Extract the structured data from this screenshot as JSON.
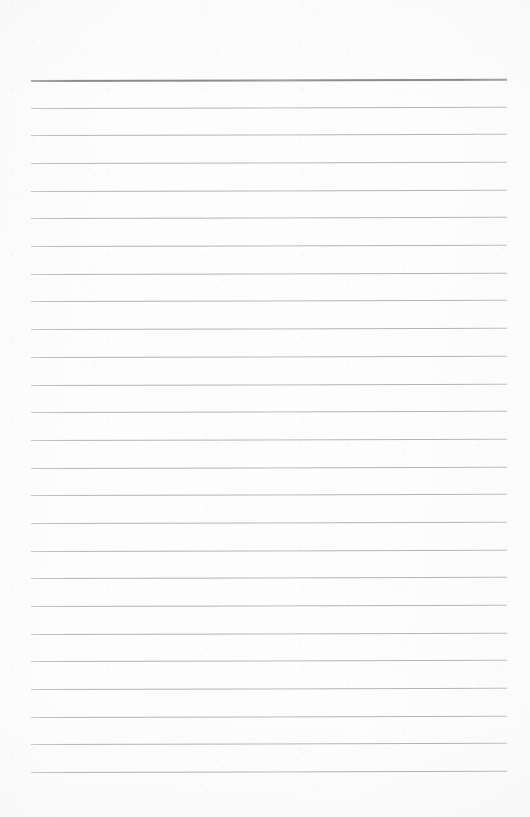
{
  "document": {
    "kind": "scanned-blank-ruled-paper",
    "page_width": 530,
    "page_height": 817,
    "background_color": "#fdfdfd",
    "text_content": "",
    "notes": "Blank lined writing paper; no text, headings, icons or page numbers are printed on the sheet."
  },
  "ruling": {
    "line_count": 26,
    "line_color": "#aeaeae",
    "header_line_color": "#8b8b8b",
    "header_line_thickness_px": 2,
    "line_thickness_px": 1,
    "line_left_px": 31,
    "line_right_px": 507,
    "line_width_px": 476,
    "first_line_y_px": 80,
    "last_line_y_px": 772,
    "line_spacing_px": 27.7,
    "tilt_degrees": -0.14,
    "lines": [
      {
        "index": 1,
        "y": 80,
        "emphasis": "header"
      },
      {
        "index": 2,
        "y": 108,
        "emphasis": "normal"
      },
      {
        "index": 3,
        "y": 135,
        "emphasis": "normal"
      },
      {
        "index": 4,
        "y": 163,
        "emphasis": "normal"
      },
      {
        "index": 5,
        "y": 191,
        "emphasis": "normal"
      },
      {
        "index": 6,
        "y": 218,
        "emphasis": "normal"
      },
      {
        "index": 7,
        "y": 246,
        "emphasis": "normal"
      },
      {
        "index": 8,
        "y": 274,
        "emphasis": "normal"
      },
      {
        "index": 9,
        "y": 301,
        "emphasis": "normal"
      },
      {
        "index": 10,
        "y": 329,
        "emphasis": "normal"
      },
      {
        "index": 11,
        "y": 357,
        "emphasis": "normal"
      },
      {
        "index": 12,
        "y": 385,
        "emphasis": "normal"
      },
      {
        "index": 13,
        "y": 412,
        "emphasis": "normal"
      },
      {
        "index": 14,
        "y": 440,
        "emphasis": "normal"
      },
      {
        "index": 15,
        "y": 468,
        "emphasis": "normal"
      },
      {
        "index": 16,
        "y": 495,
        "emphasis": "normal"
      },
      {
        "index": 17,
        "y": 523,
        "emphasis": "normal"
      },
      {
        "index": 18,
        "y": 551,
        "emphasis": "normal"
      },
      {
        "index": 19,
        "y": 578,
        "emphasis": "normal"
      },
      {
        "index": 20,
        "y": 606,
        "emphasis": "normal"
      },
      {
        "index": 21,
        "y": 634,
        "emphasis": "normal"
      },
      {
        "index": 22,
        "y": 661,
        "emphasis": "normal"
      },
      {
        "index": 23,
        "y": 689,
        "emphasis": "normal"
      },
      {
        "index": 24,
        "y": 717,
        "emphasis": "normal"
      },
      {
        "index": 25,
        "y": 744,
        "emphasis": "normal"
      },
      {
        "index": 26,
        "y": 772,
        "emphasis": "normal"
      }
    ]
  },
  "margins": {
    "top_px": 80,
    "bottom_px": 45,
    "left_px": 31,
    "right_px": 23
  }
}
